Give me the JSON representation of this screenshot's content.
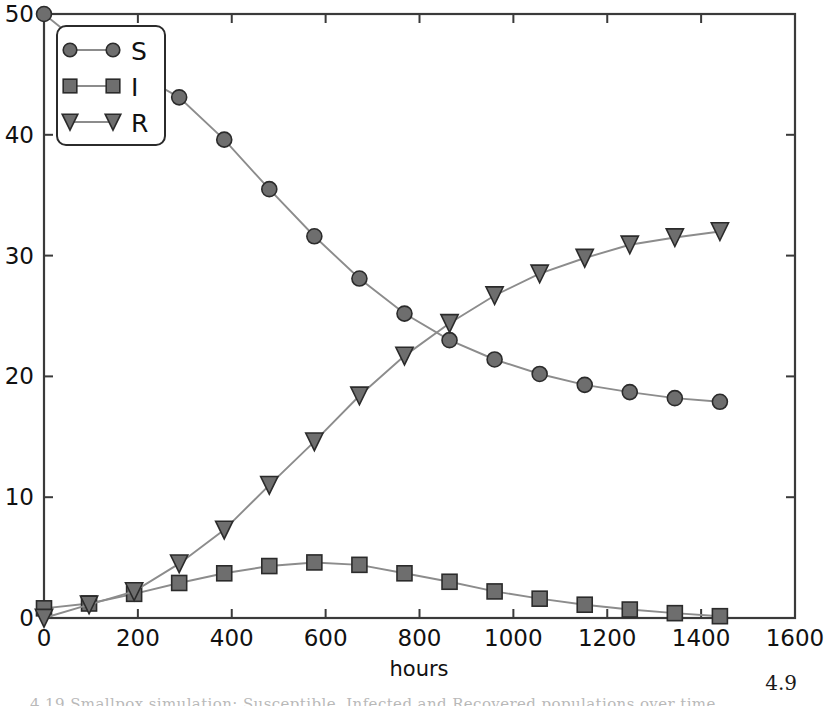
{
  "figure": {
    "background": "#ffffff",
    "corner_note": "4.9",
    "caption_fragment": "4.19   Smallpox simulation: Susceptible, Infected and Recovered populations over time",
    "axis_color": "#3a3a3a",
    "series_line_color": "#8c8c8c",
    "marker_face_color": "#6e6e6e",
    "marker_edge_color": "#2b2b2b"
  },
  "chart_data": {
    "type": "line",
    "title": "",
    "xlabel": "hours",
    "ylabel": "",
    "xlim": [
      0,
      1600
    ],
    "ylim": [
      0,
      50
    ],
    "xticks": [
      0,
      200,
      400,
      600,
      800,
      1000,
      1200,
      1400,
      1600
    ],
    "yticks": [
      0,
      10,
      20,
      30,
      40,
      50
    ],
    "xticklabels": [
      "0",
      "200",
      "400",
      "600",
      "800",
      "1000",
      "1200",
      "1400",
      "1600"
    ],
    "yticklabels": [
      "0",
      "10",
      "20",
      "30",
      "40",
      "50"
    ],
    "grid": false,
    "legend_position": "upper left",
    "x": [
      0,
      96,
      192,
      288,
      384,
      480,
      576,
      672,
      768,
      864,
      960,
      1056,
      1152,
      1248,
      1344,
      1440
    ],
    "series": [
      {
        "name": "S",
        "marker": "circle",
        "values": [
          50.0,
          47.0,
          45.2,
          43.1,
          39.6,
          35.5,
          31.6,
          28.1,
          25.2,
          23.0,
          21.4,
          20.2,
          19.3,
          18.7,
          18.2,
          17.9
        ]
      },
      {
        "name": "I",
        "marker": "square",
        "values": [
          0.8,
          1.2,
          2.0,
          2.9,
          3.7,
          4.3,
          4.6,
          4.4,
          3.7,
          3.0,
          2.2,
          1.6,
          1.1,
          0.7,
          0.4,
          0.15
        ]
      },
      {
        "name": "R",
        "marker": "triangle-down",
        "values": [
          0.0,
          1.1,
          2.2,
          4.5,
          7.3,
          11.0,
          14.6,
          18.4,
          21.7,
          24.4,
          26.7,
          28.5,
          29.8,
          30.9,
          31.5,
          32.0
        ]
      }
    ],
    "legend": [
      {
        "label": "S",
        "marker": "circle"
      },
      {
        "label": "I",
        "marker": "square"
      },
      {
        "label": "R",
        "marker": "triangle-down"
      }
    ]
  }
}
